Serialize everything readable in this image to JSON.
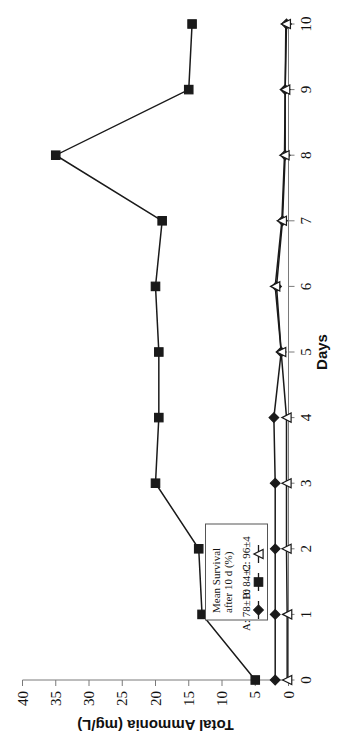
{
  "chart_data": {
    "type": "line",
    "title": "",
    "xlabel": "Days",
    "ylabel": "Total Ammonia (mg/L)",
    "x": [
      0,
      1,
      2,
      3,
      4,
      5,
      6,
      7,
      8,
      9,
      10
    ],
    "xlim": [
      0,
      10
    ],
    "ylim": [
      0,
      40
    ],
    "xticks": [
      "0",
      "1",
      "2",
      "3",
      "4",
      "5",
      "6",
      "7",
      "8",
      "9",
      "10"
    ],
    "yticks": [
      "0",
      "5",
      "10",
      "15",
      "20",
      "25",
      "30",
      "35",
      "40"
    ],
    "grid": false,
    "legend_position": "inside-lower-left",
    "legend_title_line1": "Mean Survival",
    "legend_title_line2": "after 10 d (%)",
    "series": [
      {
        "name": "A: 78±10",
        "key": "A",
        "marker": "filled-diamond",
        "color": "#1a1a1a",
        "values": [
          2.0,
          2.0,
          2.0,
          2.0,
          2.2,
          1.1,
          1.8,
          0.9,
          0.5,
          0.5,
          0.3
        ]
      },
      {
        "name": "B: 84±2",
        "key": "B",
        "marker": "filled-square",
        "color": "#1a1a1a",
        "values": [
          5.0,
          13.0,
          13.5,
          20.0,
          19.5,
          19.5,
          20.0,
          19.0,
          35.0,
          15.0,
          14.5
        ]
      },
      {
        "name": "C: 96±4",
        "key": "C",
        "marker": "open-triangle",
        "color": "#1a1a1a",
        "values": [
          0.2,
          0.2,
          0.3,
          0.3,
          0.3,
          1.1,
          2.0,
          1.0,
          0.6,
          0.5,
          0.4
        ]
      }
    ]
  },
  "figure": {
    "rotation_note": "page-rotated",
    "axis_color": "#7a7a7a",
    "line_color": "#1a1a1a"
  }
}
